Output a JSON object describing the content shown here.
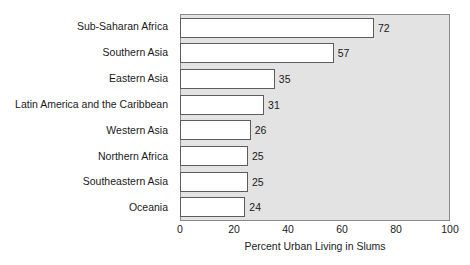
{
  "chart_data": {
    "type": "bar",
    "orientation": "horizontal",
    "title": "",
    "xlabel": "Percent Urban Living in Slums",
    "ylabel": "",
    "xlim": [
      0,
      100
    ],
    "xticks": [
      "0",
      "20",
      "40",
      "60",
      "80",
      "100"
    ],
    "grid": false,
    "legend": false,
    "categories": [
      "Sub-Saharan Africa",
      "Southern Asia",
      "Eastern Asia",
      "Latin America and the Caribbean",
      "Western Asia",
      "Northern Africa",
      "Southeastern Asia",
      "Oceania"
    ],
    "values": [
      72,
      57,
      35,
      31,
      26,
      25,
      25,
      24
    ],
    "value_labels": [
      "72",
      "57",
      "35",
      "31",
      "26",
      "25",
      "25",
      "24"
    ],
    "colors": {
      "bar_fill": "#ffffff",
      "bar_border": "#5c5c5c",
      "plot_background": "#e3e3e3",
      "plot_border": "#8a8a8a",
      "text": "#1a1a1a",
      "page_background": "#ffffff"
    }
  }
}
